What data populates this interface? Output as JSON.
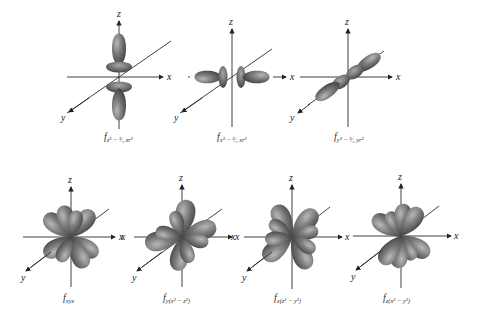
{
  "figure": {
    "colors": {
      "lobe_dark": "#3f3f3f",
      "lobe_mid": "#7a7a7a",
      "lobe_light": "#b8b8b8",
      "axis": "#2a2a2a",
      "background": "#ffffff"
    },
    "axis_labels": {
      "x": "x",
      "y": "y",
      "z": "z"
    },
    "orbitals": [
      {
        "id": "fz3",
        "label_main": "f",
        "label_sub": "z³ − ³⁄₅ zr²",
        "row": 1
      },
      {
        "id": "fx3",
        "label_main": "f",
        "label_sub": "x³ − ³⁄₅ xr²",
        "row": 1
      },
      {
        "id": "fy3",
        "label_main": "f",
        "label_sub": "y³ − ³⁄₅ yr²",
        "row": 1
      },
      {
        "id": "fxyz",
        "label_main": "f",
        "label_sub": "xyz",
        "row": 2
      },
      {
        "id": "fy_x2-z2",
        "label_main": "f",
        "label_sub": "y(x² − z²)",
        "row": 2
      },
      {
        "id": "fx_z2-y2",
        "label_main": "f",
        "label_sub": "x(z² − y²)",
        "row": 2
      },
      {
        "id": "fz_x2-y2",
        "label_main": "f",
        "label_sub": "z(x² − y²)",
        "row": 2
      }
    ]
  }
}
